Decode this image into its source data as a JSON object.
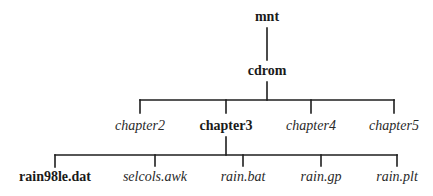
{
  "diagram": {
    "type": "directory-tree",
    "line_color": "#1e1e1e",
    "root": {
      "label": "mnt",
      "style": "bold",
      "x": 267,
      "y": 11,
      "children": [
        {
          "label": "cdrom",
          "style": "bold",
          "x": 267,
          "y": 64,
          "children": [
            {
              "label": "chapter2",
              "style": "italic",
              "x": 140,
              "y": 119
            },
            {
              "label": "chapter3",
              "style": "bold",
              "x": 226,
              "y": 119,
              "children": [
                {
                  "label": "rain98le.dat",
                  "style": "bold",
                  "x": 55,
                  "y": 169
                },
                {
                  "label": "selcols.awk",
                  "style": "italic",
                  "x": 155,
                  "y": 169
                },
                {
                  "label": "rain.bat",
                  "style": "italic",
                  "x": 243,
                  "y": 169
                },
                {
                  "label": "rain.gp",
                  "style": "italic",
                  "x": 321,
                  "y": 169
                },
                {
                  "label": "rain.plt",
                  "style": "italic",
                  "x": 397,
                  "y": 169
                }
              ]
            },
            {
              "label": "chapter4",
              "style": "italic",
              "x": 311,
              "y": 119
            },
            {
              "label": "chapter5",
              "style": "italic",
              "x": 394,
              "y": 119
            }
          ]
        }
      ]
    }
  },
  "labels": {
    "mnt": "mnt",
    "cdrom": "cdrom",
    "chapter2": "chapter2",
    "chapter3": "chapter3",
    "chapter4": "chapter4",
    "chapter5": "chapter5",
    "rain98le_dat": "rain98le.dat",
    "selcols_awk": "selcols.awk",
    "rain_bat": "rain.bat",
    "rain_gp": "rain.gp",
    "rain_plt": "rain.plt"
  }
}
